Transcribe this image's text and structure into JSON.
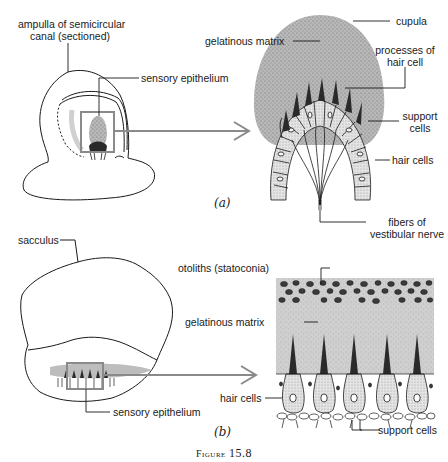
{
  "figure": {
    "caption_word": "Figure",
    "caption_number": "15.8"
  },
  "panel_a": {
    "label": "(a)",
    "labels": {
      "ampulla_line1": "ampulla of semicircular",
      "ampulla_line2": "canal (sectioned)",
      "sensory_epithelium": "sensory epithelium",
      "gelatinous_matrix": "gelatinous matrix",
      "cupula": "cupula",
      "processes_line1": "processes of",
      "processes_line2": "hair cell",
      "support_line1": "support",
      "support_line2": "cells",
      "hair_cells": "hair cells",
      "fibers_line1": "fibers of",
      "fibers_line2": "vestibular nerve"
    }
  },
  "panel_b": {
    "label": "(b)",
    "labels": {
      "sacculus": "sacculus",
      "otoliths": "otoliths (statoconia)",
      "gelatinous_matrix": "gelatinous matrix",
      "hair_cells": "hair cells",
      "sensory_epithelium": "sensory epithelium",
      "support_cells": "support cells"
    }
  },
  "colors": {
    "line": "#1a1a1a",
    "highlight_box": "#8a8a8a",
    "matrix_fill": "#c9c9c9",
    "otolith_fill": "#3a3a3a",
    "hair_process": "#2a2a2a"
  }
}
